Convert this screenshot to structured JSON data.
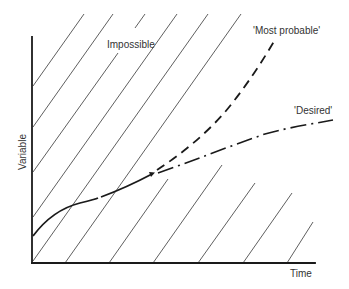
{
  "figure": {
    "type": "conceptual diagram",
    "axes": {
      "x_label": "Time",
      "y_label": "Variable"
    },
    "regions": {
      "hatched_region_label": "Impossible"
    },
    "curves": {
      "history": {
        "style": "solid",
        "label": ""
      },
      "most_probable": {
        "style": "dashed",
        "label": "'Most probable'"
      },
      "desired": {
        "style": "dash-dot",
        "label": "'Desired'"
      }
    },
    "colors": {
      "ink": "#1a1a1a",
      "text": "#333333",
      "background": "#ffffff"
    }
  }
}
